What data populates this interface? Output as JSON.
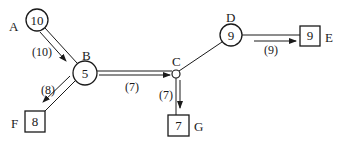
{
  "nodes": {
    "A": {
      "label": "A",
      "value": "10",
      "shape": "circle"
    },
    "B": {
      "label": "B",
      "value": "5",
      "shape": "circle"
    },
    "C": {
      "label": "C",
      "value": "",
      "shape": "small-circle"
    },
    "D": {
      "label": "D",
      "value": "9",
      "shape": "circle"
    },
    "E": {
      "label": "E",
      "value": "9",
      "shape": "square"
    },
    "F": {
      "label": "F",
      "value": "8",
      "shape": "square"
    },
    "G": {
      "label": "G",
      "value": "7",
      "shape": "square"
    }
  },
  "edges": {
    "AB": {
      "flow": "(10)"
    },
    "BF": {
      "flow": "(8)"
    },
    "BC": {
      "flow": "(7)"
    },
    "CG": {
      "flow": "(7)"
    },
    "CD": {
      "flow": ""
    },
    "DE": {
      "flow": "(9)"
    }
  },
  "colors": {
    "stroke": "#1a1a1a",
    "background": "#ffffff"
  }
}
